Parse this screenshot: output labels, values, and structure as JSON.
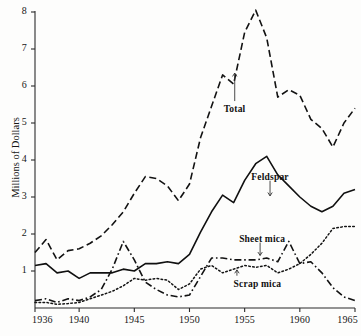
{
  "chart_data": {
    "type": "line",
    "title": "",
    "xlabel": "",
    "ylabel": "Millions of Dollars",
    "xlim": [
      1936,
      1965
    ],
    "ylim": [
      0,
      8
    ],
    "grid": false,
    "legend_position": "inline-annotations",
    "x_ticks": [
      1936,
      1940,
      1945,
      1950,
      1955,
      1960,
      1965
    ],
    "x_tick_labels": [
      "1936",
      "1940",
      "1945",
      "1950",
      "1955",
      "1960",
      "1965"
    ],
    "y_ticks": [
      1,
      2,
      3,
      4,
      5,
      6,
      7,
      8
    ],
    "y_tick_labels": [
      "1",
      "2",
      "3",
      "4",
      "5",
      "6",
      "7",
      "8"
    ],
    "x": [
      1936,
      1937,
      1938,
      1939,
      1940,
      1941,
      1942,
      1943,
      1944,
      1945,
      1946,
      1947,
      1948,
      1949,
      1950,
      1951,
      1952,
      1953,
      1954,
      1955,
      1956,
      1957,
      1958,
      1959,
      1960,
      1961,
      1962,
      1963,
      1964,
      1965
    ],
    "series": [
      {
        "name": "Total",
        "style": "dashed",
        "color": "#121212",
        "values": [
          1.5,
          1.85,
          1.3,
          1.55,
          1.6,
          1.75,
          1.95,
          2.25,
          2.6,
          3.1,
          3.55,
          3.5,
          3.3,
          2.9,
          3.35,
          4.6,
          5.45,
          6.3,
          6.05,
          7.45,
          8.05,
          7.3,
          5.7,
          5.9,
          5.75,
          5.1,
          4.85,
          4.35,
          5.0,
          5.4
        ]
      },
      {
        "name": "Feldspar",
        "style": "solid",
        "color": "#101010",
        "values": [
          1.15,
          1.2,
          0.95,
          1.0,
          0.8,
          0.95,
          0.95,
          0.95,
          1.05,
          1.0,
          1.2,
          1.2,
          1.25,
          1.2,
          1.45,
          2.05,
          2.6,
          3.05,
          2.85,
          3.45,
          3.9,
          4.1,
          3.6,
          3.3,
          3.0,
          2.75,
          2.6,
          2.75,
          3.1,
          3.2
        ]
      },
      {
        "name": "Sheet mica",
        "style": "dash-dot",
        "color": "#121212",
        "values": [
          0.2,
          0.25,
          0.15,
          0.25,
          0.2,
          0.3,
          0.5,
          1.05,
          1.8,
          1.3,
          0.7,
          0.5,
          0.35,
          0.3,
          0.35,
          0.85,
          1.35,
          1.35,
          1.3,
          1.3,
          1.3,
          1.35,
          1.25,
          1.8,
          1.2,
          1.25,
          0.95,
          0.55,
          0.3,
          0.2
        ]
      },
      {
        "name": "Scrap mica",
        "style": "dotted",
        "color": "#141414",
        "values": [
          0.15,
          0.15,
          0.1,
          0.12,
          0.15,
          0.25,
          0.35,
          0.45,
          0.6,
          0.8,
          0.75,
          0.8,
          0.75,
          0.5,
          0.65,
          1.05,
          1.15,
          0.95,
          1.05,
          1.15,
          1.1,
          1.15,
          0.95,
          1.05,
          1.2,
          1.45,
          1.75,
          2.15,
          2.2,
          2.2
        ]
      }
    ],
    "annotations": [
      {
        "text": "Total",
        "x": 1953.1,
        "y": 5.35,
        "leader_to_x": 1954.1,
        "leader_to_y": 6.35
      },
      {
        "text": "Feldspar",
        "x": 1955.6,
        "y": 3.52,
        "leader_to_x": 1957.3,
        "leader_to_y": 3.03
      },
      {
        "text": "Sheet mica",
        "x": 1954.5,
        "y": 1.85,
        "leader_to_x": 1956.4,
        "leader_to_y": 1.42
      },
      {
        "text": "Scrap mica",
        "x": 1954.0,
        "y": 0.63,
        "leader_to_x": 1954.3,
        "leader_to_y": 1.03
      }
    ]
  }
}
